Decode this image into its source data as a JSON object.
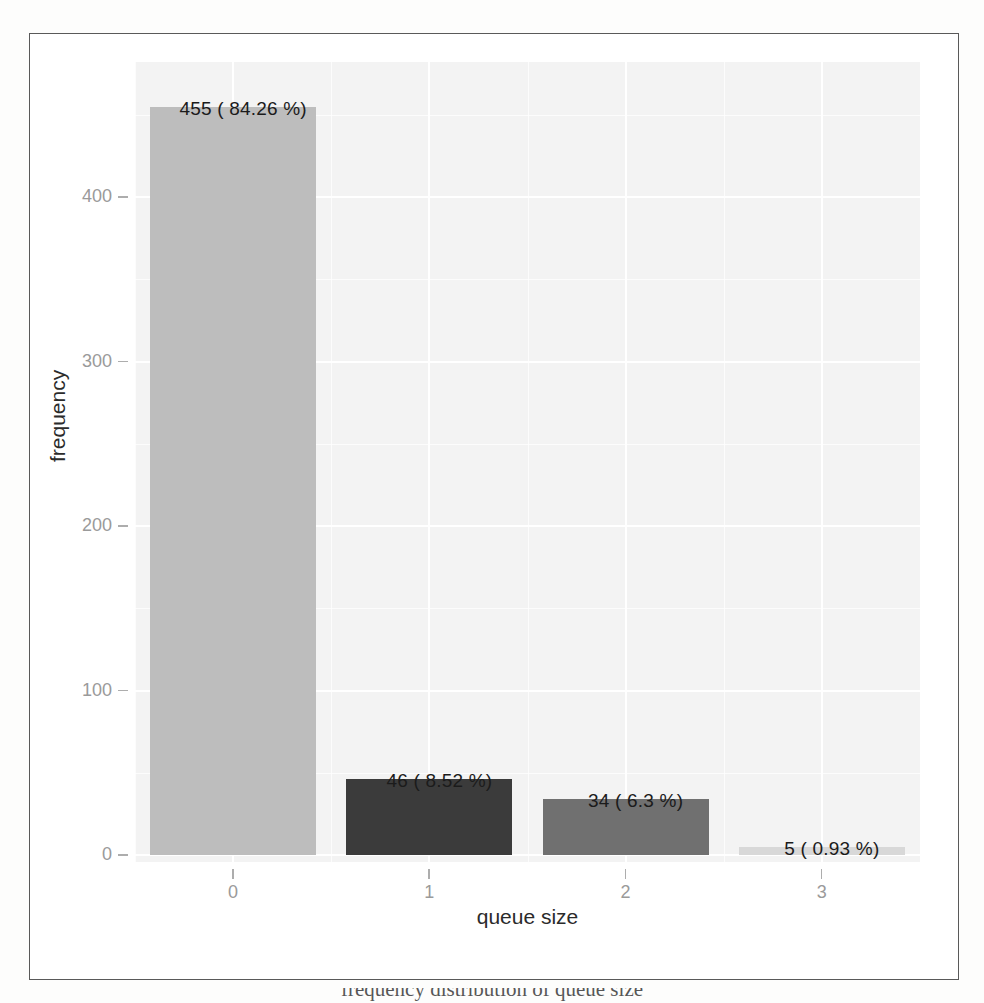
{
  "figure": {
    "kind": "bar-chart",
    "panel_background": "#f3f3f3",
    "frame_color": "#595959"
  },
  "axes": {
    "y_title": "frequency",
    "x_title": "queue size",
    "y_ticks": [
      "0",
      "100",
      "200",
      "300",
      "400"
    ],
    "x_ticks": [
      "0",
      "1",
      "2",
      "3"
    ]
  },
  "bars": [
    {
      "category": "0",
      "count": 455,
      "percent": 84.26,
      "label": "455 ( 84.26 %)",
      "color": "#bdbdbd"
    },
    {
      "category": "1",
      "count": 46,
      "percent": 8.52,
      "label": "46 ( 8.52 %)",
      "color": "#3b3b3b"
    },
    {
      "category": "2",
      "count": 34,
      "percent": 6.3,
      "label": "34 ( 6.3 %)",
      "color": "#707070"
    },
    {
      "category": "3",
      "count": 5,
      "percent": 0.93,
      "label": "5 ( 0.93 %)",
      "color": "#d8d8d8"
    }
  ],
  "caption_bleed": "frequency distribution of queue size",
  "chart_data": {
    "type": "bar",
    "title": "",
    "subtitle": "",
    "categories": [
      "0",
      "1",
      "2",
      "3"
    ],
    "values": [
      455,
      46,
      34,
      5
    ],
    "percentages": [
      84.26,
      8.52,
      6.3,
      0.93
    ],
    "data_labels": [
      "455 ( 84.26 %)",
      "46 ( 8.52 %)",
      "34 ( 6.3 %)",
      "5 ( 0.93 %)"
    ],
    "bar_colors": [
      "#bdbdbd",
      "#3b3b3b",
      "#707070",
      "#d8d8d8"
    ],
    "xlabel": "queue size",
    "ylabel": "frequency",
    "ylim": [
      0,
      470
    ],
    "y_ticks": [
      0,
      100,
      200,
      300,
      400
    ],
    "x_ticks": [
      "0",
      "1",
      "2",
      "3"
    ],
    "grid": true,
    "grid_color": "#ffffff",
    "legend": "none",
    "total_observations": 540
  }
}
